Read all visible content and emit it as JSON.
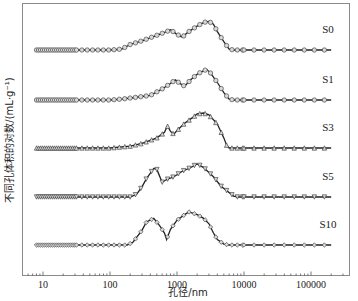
{
  "chart_data": {
    "type": "line",
    "title": "",
    "xlabel": "孔径/nm",
    "ylabel": "不同孔体积的对数/(mL·g⁻¹)",
    "xscale": "log",
    "xlim": [
      6,
      250000
    ],
    "xticks": [
      10,
      100,
      1000,
      10000,
      100000
    ],
    "xtick_labels": [
      "10",
      "100",
      "1000",
      "10000",
      "100000"
    ],
    "y_ticks_shown": false,
    "grid": false,
    "legend": "inline labels at right of each curve",
    "layout_note": "Curves are vertically offset (stacked) for clarity; y values are relative heights above each curve's baseline (arbitrary units, 0–1).",
    "series": [
      {
        "name": "S0",
        "marker": "circle",
        "points": [
          [
            8,
            0
          ],
          [
            30,
            0
          ],
          [
            60,
            0
          ],
          [
            100,
            0
          ],
          [
            150,
            0.02
          ],
          [
            200,
            0.12
          ],
          [
            300,
            0.2
          ],
          [
            500,
            0.32
          ],
          [
            700,
            0.4
          ],
          [
            800,
            0.44
          ],
          [
            1000,
            0.34
          ],
          [
            1200,
            0.28
          ],
          [
            1500,
            0.4
          ],
          [
            2000,
            0.52
          ],
          [
            2500,
            0.6
          ],
          [
            3000,
            0.62
          ],
          [
            3500,
            0.56
          ],
          [
            4000,
            0.4
          ],
          [
            5000,
            0.18
          ],
          [
            6000,
            0.02
          ],
          [
            7000,
            0
          ],
          [
            20000,
            0
          ],
          [
            100000,
            0
          ],
          [
            200000,
            0
          ]
        ]
      },
      {
        "name": "S1",
        "marker": "circle",
        "points": [
          [
            8,
            0
          ],
          [
            30,
            0
          ],
          [
            60,
            0
          ],
          [
            100,
            0
          ],
          [
            150,
            0.02
          ],
          [
            250,
            0.06
          ],
          [
            400,
            0.1
          ],
          [
            600,
            0.24
          ],
          [
            800,
            0.36
          ],
          [
            950,
            0.44
          ],
          [
            1100,
            0.36
          ],
          [
            1300,
            0.3
          ],
          [
            1600,
            0.44
          ],
          [
            2000,
            0.56
          ],
          [
            2500,
            0.64
          ],
          [
            2800,
            0.66
          ],
          [
            3200,
            0.58
          ],
          [
            4000,
            0.38
          ],
          [
            5000,
            0.16
          ],
          [
            6000,
            0.02
          ],
          [
            7000,
            0
          ],
          [
            20000,
            0
          ],
          [
            100000,
            0
          ],
          [
            200000,
            0
          ]
        ]
      },
      {
        "name": "S3",
        "marker": "triangle-up",
        "points": [
          [
            8,
            0
          ],
          [
            30,
            0
          ],
          [
            60,
            0
          ],
          [
            100,
            0
          ],
          [
            200,
            0.04
          ],
          [
            300,
            0.1
          ],
          [
            500,
            0.22
          ],
          [
            650,
            0.34
          ],
          [
            720,
            0.48
          ],
          [
            800,
            0.36
          ],
          [
            900,
            0.3
          ],
          [
            1000,
            0.38
          ],
          [
            1300,
            0.54
          ],
          [
            1700,
            0.66
          ],
          [
            2000,
            0.74
          ],
          [
            2500,
            0.76
          ],
          [
            3000,
            0.72
          ],
          [
            4000,
            0.52
          ],
          [
            5000,
            0.22
          ],
          [
            5500,
            0.06
          ],
          [
            6000,
            0
          ],
          [
            20000,
            0
          ],
          [
            100000,
            0
          ],
          [
            200000,
            0
          ]
        ]
      },
      {
        "name": "S5",
        "marker": "triangle-down",
        "points": [
          [
            8,
            0
          ],
          [
            30,
            0
          ],
          [
            60,
            0
          ],
          [
            100,
            0
          ],
          [
            200,
            0
          ],
          [
            250,
            0.06
          ],
          [
            300,
            0.22
          ],
          [
            350,
            0.4
          ],
          [
            450,
            0.62
          ],
          [
            500,
            0.6
          ],
          [
            600,
            0.32
          ],
          [
            700,
            0.38
          ],
          [
            900,
            0.44
          ],
          [
            1200,
            0.56
          ],
          [
            1500,
            0.62
          ],
          [
            1800,
            0.68
          ],
          [
            2000,
            0.72
          ],
          [
            2500,
            0.64
          ],
          [
            3500,
            0.44
          ],
          [
            4500,
            0.24
          ],
          [
            7000,
            0.02
          ],
          [
            8000,
            0
          ],
          [
            20000,
            0
          ],
          [
            100000,
            0
          ],
          [
            200000,
            0
          ]
        ]
      },
      {
        "name": "S10",
        "marker": "diamond",
        "points": [
          [
            8,
            0
          ],
          [
            30,
            0
          ],
          [
            60,
            0
          ],
          [
            100,
            0
          ],
          [
            180,
            0
          ],
          [
            220,
            0.06
          ],
          [
            300,
            0.32
          ],
          [
            350,
            0.5
          ],
          [
            450,
            0.58
          ],
          [
            550,
            0.42
          ],
          [
            650,
            0.26
          ],
          [
            700,
            0.12
          ],
          [
            800,
            0.34
          ],
          [
            1000,
            0.54
          ],
          [
            1300,
            0.66
          ],
          [
            1500,
            0.72
          ],
          [
            2000,
            0.66
          ],
          [
            2500,
            0.58
          ],
          [
            3000,
            0.46
          ],
          [
            3500,
            0.26
          ],
          [
            4000,
            0.12
          ],
          [
            5000,
            0.02
          ],
          [
            6000,
            0
          ],
          [
            20000,
            0
          ],
          [
            100000,
            0
          ],
          [
            200000,
            0
          ]
        ]
      }
    ]
  },
  "labels": {
    "xlabel": "孔径/nm",
    "ylabel": "不同孔体积的对数/(mL·g⁻¹)",
    "series": [
      "S0",
      "S1",
      "S3",
      "S5",
      "S10"
    ],
    "xticks": [
      "10",
      "100",
      "1000",
      "10000",
      "100000"
    ]
  }
}
